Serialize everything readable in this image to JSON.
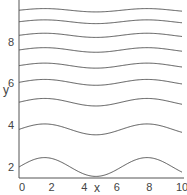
{
  "chart_data": {
    "type": "line",
    "title": "",
    "xlabel": "x",
    "ylabel": "y",
    "xlim": [
      0,
      10
    ],
    "ylim": [
      1.3,
      10
    ],
    "grid": false,
    "legend": null,
    "x_ticks": [
      "0",
      "2",
      "4",
      "6",
      "8",
      "10"
    ],
    "y_ticks": [
      "2",
      "4",
      "6",
      "8"
    ],
    "function_form": "y = c + a*sin(x)",
    "series": [
      {
        "name": "curve-1",
        "offset": 2.0,
        "amplitude": 0.45
      },
      {
        "name": "curve-2",
        "offset": 3.8,
        "amplitude": 0.26
      },
      {
        "name": "curve-3",
        "offset": 5.1,
        "amplitude": 0.18
      },
      {
        "name": "curve-4",
        "offset": 6.05,
        "amplitude": 0.14
      },
      {
        "name": "curve-5",
        "offset": 6.85,
        "amplitude": 0.12
      },
      {
        "name": "curve-6",
        "offset": 7.6,
        "amplitude": 0.11
      },
      {
        "name": "curve-7",
        "offset": 8.3,
        "amplitude": 0.1
      },
      {
        "name": "curve-8",
        "offset": 8.95,
        "amplitude": 0.09
      },
      {
        "name": "curve-9",
        "offset": 9.5,
        "amplitude": 0.08
      }
    ]
  }
}
